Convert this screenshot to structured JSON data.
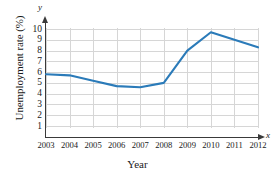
{
  "chart_data": {
    "type": "line",
    "title": "",
    "xlabel": "Year",
    "ylabel": "Unemployment rate (%)",
    "x_axis_letter": "x",
    "y_axis_letter": "y",
    "categories": [
      2003,
      2004,
      2005,
      2006,
      2007,
      2008,
      2009,
      2010,
      2011,
      2012
    ],
    "xticklabels": [
      "2003",
      "2004",
      "2005",
      "2006",
      "2007",
      "2008",
      "2009",
      "2010",
      "2011",
      "2012"
    ],
    "values": [
      5.8,
      5.7,
      5.2,
      4.7,
      4.6,
      5.0,
      8.0,
      9.7,
      9.0,
      8.3
    ],
    "yticks": [
      1,
      2,
      3,
      4,
      5,
      6,
      7,
      8,
      9,
      10
    ],
    "yticklabels": [
      "1",
      "2",
      "3",
      "4",
      "5",
      "6",
      "7",
      "8",
      "9",
      "10"
    ],
    "xlim": [
      2003,
      2012
    ],
    "ylim": [
      0,
      10.4
    ],
    "grid": true,
    "legend": false,
    "series_color": "#2b7bb9",
    "grid_color": "#d6d6d6",
    "axis_color": "#3a3a3a",
    "background": "#ffffff"
  }
}
